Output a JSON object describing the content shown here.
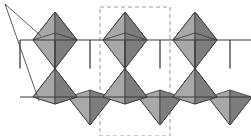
{
  "figure": {
    "width": 251,
    "height": 136,
    "background_color": "#ffffff"
  },
  "colors": {
    "face_light": "#c9c9c9",
    "face_mid": "#a8a8a8",
    "face_dark": "#7d7d7d",
    "face_darker": "#6a6a6a",
    "outline": "#3a3a3a",
    "unit_cell_dash": "#9a9a9a",
    "leader_line": "#4a4a4a"
  },
  "unit_cell": {
    "label": "unit-cell-outline",
    "style": "dashed",
    "x": 100,
    "y": 7,
    "width": 70,
    "height": 129,
    "stroke": "#9a9a9a",
    "dash_pattern": "4,3",
    "stroke_width": 1
  },
  "leader_lines": {
    "label": "leader-lines",
    "origin_x": 5,
    "origin_y": 4,
    "targets": [
      {
        "x": 41,
        "y": 36
      },
      {
        "x": 39,
        "y": 101
      }
    ],
    "stroke": "#4a4a4a",
    "stroke_width": 0.9
  },
  "band_lines": {
    "upper_y": 40,
    "lower_y": 97,
    "x_start": 20,
    "x_end": 251,
    "stroke": "#3a3a3a",
    "stroke_width": 1.1
  },
  "geometry": {
    "period_x": 70,
    "half_period_x": 35,
    "apex_top_y": 12,
    "apex_bottom_y": 125,
    "mid_y": 68.5,
    "node_xs": [
      20,
      55,
      90,
      125,
      160,
      195,
      230
    ],
    "up_apex_xs": [
      90,
      160,
      230
    ],
    "down_apex_xs": [
      55,
      125,
      195
    ],
    "top_tetra_apex_xs": [
      55,
      125,
      195
    ],
    "bottom_tetra_apex_xs": [
      90,
      160,
      230
    ],
    "hourglass_xs": [
      55,
      125,
      195
    ]
  },
  "chart_data": {
    "type": "diagram",
    "elements": [
      {
        "name": "upward-tetrahedron",
        "count": 3,
        "row": "top"
      },
      {
        "name": "downward-tetrahedron",
        "count": 3,
        "row": "bottom"
      },
      {
        "name": "hourglass-tetrahedron-pair",
        "count": 3,
        "row": "middle"
      },
      {
        "name": "unit-cell-rectangle",
        "count": 1
      },
      {
        "name": "leader-line",
        "count": 2
      }
    ]
  }
}
